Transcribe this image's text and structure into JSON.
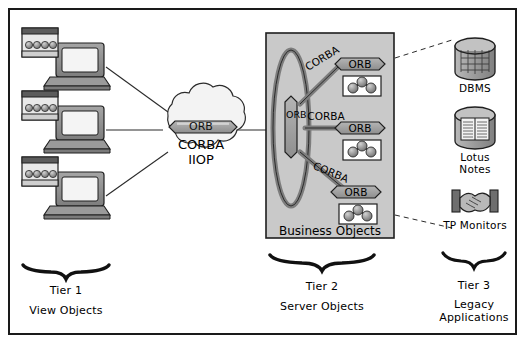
{
  "diagram": {
    "colors": {
      "line": "#1a1a1a",
      "box_fill": "#c9c9c9",
      "orb_fill": "#9a9a9a",
      "cloud_fill": "#f2f2f2",
      "monitor_body": "#8c8c8c",
      "monitor_dark": "#555555",
      "screen": "#f4f4f4",
      "cyl_fill": "#a8a8a8"
    }
  },
  "tier1": {
    "clients": [
      {
        "name": "workstation-1"
      },
      {
        "name": "workstation-2"
      },
      {
        "name": "workstation-3"
      }
    ],
    "brace_label": "Tier 1",
    "brace_sub": "View Objects"
  },
  "cloud": {
    "orb_label": "ORB",
    "line1": "CORBA",
    "line2": "IIOP"
  },
  "tier2": {
    "box_label": "Business Objects",
    "bus_orb_label": "ORB",
    "links": [
      {
        "label": "CORBA"
      },
      {
        "label": "CORBA"
      },
      {
        "label": "CORBA"
      }
    ],
    "servers": [
      {
        "orb_label": "ORB"
      },
      {
        "orb_label": "ORB"
      },
      {
        "orb_label": "ORB"
      }
    ],
    "brace_label": "Tier 2",
    "brace_sub": "Server Objects"
  },
  "tier3": {
    "systems": [
      {
        "label": "DBMS",
        "icon": "database-cylinder-icon"
      },
      {
        "label": "Lotus\nNotes",
        "icon": "notes-cylinder-icon"
      },
      {
        "label": "TP Monitors",
        "icon": "handshake-icon"
      }
    ],
    "brace_label": "Tier 3",
    "brace_sub": "Legacy\nApplications"
  }
}
